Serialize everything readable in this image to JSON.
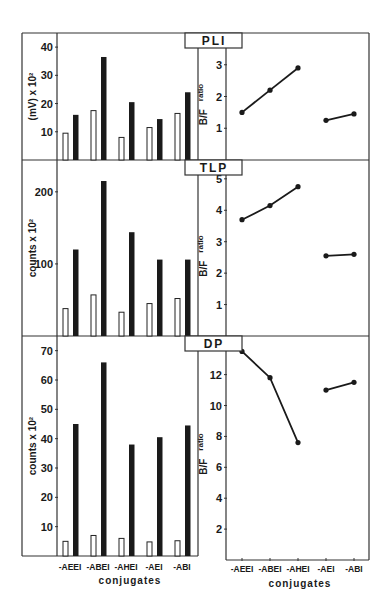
{
  "figure": {
    "x_title": "conjugates",
    "categories": [
      "-AEEI",
      "-ABEI",
      "-AHEI",
      "-AEI",
      "-ABI"
    ]
  },
  "chart_data": [
    {
      "type": "bar",
      "panel": "PLI",
      "title": "PLI",
      "ylabel": "(mV) x 10²",
      "ylim": [
        0,
        45
      ],
      "yticks": [
        10,
        20,
        30,
        40
      ],
      "categories": [
        "-AEEI",
        "-ABEI",
        "-AHEI",
        "-AEI",
        "-ABI"
      ],
      "series": [
        {
          "name": "open",
          "style": "open",
          "values": [
            9.5,
            17.5,
            8,
            11.5,
            16.5
          ]
        },
        {
          "name": "filled",
          "style": "filled",
          "values": [
            16,
            36.5,
            20.5,
            14.5,
            24
          ]
        }
      ]
    },
    {
      "type": "line",
      "panel": "PLI",
      "title": "PLI",
      "ylabel": "B/F ratio",
      "ylim": [
        0,
        4
      ],
      "yticks": [
        1,
        2,
        3
      ],
      "categories": [
        "-AEEI",
        "-ABEI",
        "-AHEI",
        "-AEI",
        "-ABI"
      ],
      "segments": [
        [
          0,
          1,
          2
        ],
        [
          3,
          4
        ]
      ],
      "values": [
        1.5,
        2.2,
        2.9,
        1.25,
        1.45
      ]
    },
    {
      "type": "bar",
      "panel": "TLP",
      "title": "TLP",
      "ylabel": "counts x 10²",
      "ylim": [
        0,
        240
      ],
      "yticks": [
        100,
        200
      ],
      "categories": [
        "-AEEI",
        "-ABEI",
        "-AHEI",
        "-AEI",
        "-ABI"
      ],
      "series": [
        {
          "name": "open",
          "style": "open",
          "values": [
            38,
            57,
            33,
            45,
            52
          ]
        },
        {
          "name": "filled",
          "style": "filled",
          "values": [
            120,
            215,
            144,
            106,
            106
          ]
        }
      ]
    },
    {
      "type": "line",
      "panel": "TLP",
      "title": "TLP",
      "ylabel": "B/F ratio",
      "ylim": [
        0,
        5.6
      ],
      "yticks": [
        1,
        2,
        3,
        4,
        5
      ],
      "categories": [
        "-AEEI",
        "-ABEI",
        "-AHEI",
        "-AEI",
        "-ABI"
      ],
      "segments": [
        [
          0,
          1,
          2
        ],
        [
          3,
          4
        ]
      ],
      "values": [
        3.7,
        4.15,
        4.75,
        2.55,
        2.6
      ]
    },
    {
      "type": "bar",
      "panel": "DP",
      "title": "DP",
      "ylabel": "counts x 10²",
      "ylim": [
        0,
        75
      ],
      "yticks": [
        10,
        20,
        30,
        40,
        50,
        60,
        70
      ],
      "xlabel": "conjugates",
      "categories": [
        "-AEEI",
        "-ABEI",
        "-AHEI",
        "-AEI",
        "-ABI"
      ],
      "series": [
        {
          "name": "open",
          "style": "open",
          "values": [
            5,
            7,
            6,
            4.8,
            5.2
          ]
        },
        {
          "name": "filled",
          "style": "filled",
          "values": [
            45,
            66,
            38,
            40.5,
            44.5
          ]
        }
      ]
    },
    {
      "type": "line",
      "panel": "DP",
      "title": "DP",
      "ylabel": "B/F ratio",
      "ylim": [
        0,
        14.5
      ],
      "yticks": [
        2,
        4,
        6,
        8,
        10,
        12
      ],
      "xlabel": "conjugates",
      "categories": [
        "-AEEI",
        "-ABEI",
        "-AHEI",
        "-AEI",
        "-ABI"
      ],
      "segments": [
        [
          0,
          1,
          2
        ],
        [
          3,
          4
        ]
      ],
      "values": [
        13.5,
        11.8,
        7.6,
        11.0,
        11.5
      ]
    }
  ]
}
